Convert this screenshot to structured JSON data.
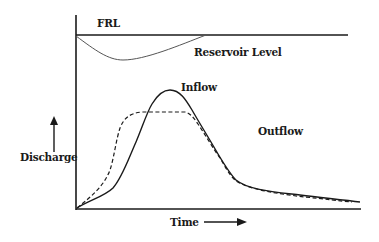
{
  "diagram": {
    "type": "reservoir-routing-hydrograph",
    "labels": {
      "frl": "FRL",
      "reservoir_level": "Reservoir Level",
      "inflow": "Inflow",
      "outflow": "Outflow",
      "y_axis": "Discharge",
      "x_axis": "Time"
    },
    "curves": [
      {
        "name": "Inflow",
        "style": "solid"
      },
      {
        "name": "Outflow",
        "style": "dashed"
      },
      {
        "name": "Reservoir Level",
        "style": "solid-thin"
      },
      {
        "name": "FRL",
        "style": "solid-horizontal"
      }
    ],
    "colors": {
      "ink": "#1a1a1a",
      "thin_ink": "#555555",
      "background": "#ffffff"
    }
  }
}
